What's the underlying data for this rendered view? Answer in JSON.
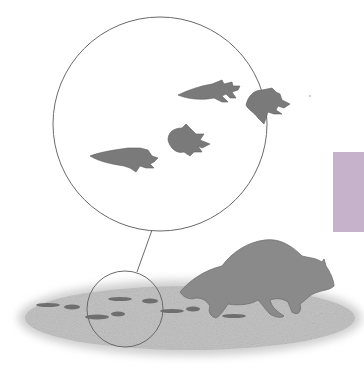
{
  "illustration": {
    "subject": "raccoon walking with tracks and magnified inset of paw prints",
    "colors": {
      "background": "#ffffff",
      "ground": "#c8c8c8",
      "raccoon": "#8a8a8a",
      "tracks": "#6e6e6e",
      "outline": "#6a6a6a",
      "accent_block": "#c6b3cb"
    },
    "magnifier": {
      "large_circle": {
        "cx": 160,
        "cy": 124,
        "r": 107
      },
      "small_circle": {
        "cx": 125,
        "cy": 309,
        "r": 38
      },
      "print_count_in_inset": 4
    }
  }
}
